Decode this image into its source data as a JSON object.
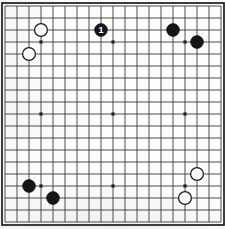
{
  "diagram": {
    "kind": "go-board-diagram",
    "board_size": 19,
    "geometry": {
      "origin_x": 5,
      "origin_y": 6,
      "spacing": 12,
      "stone_radius": 6.4,
      "border_inset": 3.0
    },
    "colors": {
      "paper": "#fdfdfb",
      "grid_line": "#3b3b3b",
      "border_line": "#1d1d1d",
      "star_point": "#202020",
      "black_stone": "#161616",
      "white_stone": "#fdfdfd",
      "black_label_text": "#ffffff"
    },
    "star_points": [
      {
        "col": 4,
        "row": 4
      },
      {
        "col": 10,
        "row": 4
      },
      {
        "col": 16,
        "row": 4
      },
      {
        "col": 4,
        "row": 10
      },
      {
        "col": 10,
        "row": 10
      },
      {
        "col": 16,
        "row": 10
      },
      {
        "col": 4,
        "row": 16
      },
      {
        "col": 10,
        "row": 16
      },
      {
        "col": 16,
        "row": 16
      }
    ],
    "stones": [
      {
        "id": "w-1",
        "color": "white",
        "col": 4,
        "row": 3,
        "label": ""
      },
      {
        "id": "w-2",
        "color": "white",
        "col": 3,
        "row": 5,
        "label": ""
      },
      {
        "id": "b-1",
        "color": "black",
        "col": 9,
        "row": 3,
        "label": "1"
      },
      {
        "id": "b-2",
        "color": "black",
        "col": 15,
        "row": 3,
        "label": ""
      },
      {
        "id": "b-3",
        "color": "black",
        "col": 17,
        "row": 4,
        "label": ""
      },
      {
        "id": "b-4",
        "color": "black",
        "col": 3,
        "row": 16,
        "label": ""
      },
      {
        "id": "b-5",
        "color": "black",
        "col": 5,
        "row": 17,
        "label": ""
      },
      {
        "id": "w-3",
        "color": "white",
        "col": 17,
        "row": 15,
        "label": ""
      },
      {
        "id": "w-4",
        "color": "white",
        "col": 16,
        "row": 17,
        "label": ""
      }
    ]
  }
}
